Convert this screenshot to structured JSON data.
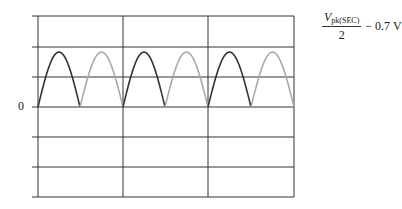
{
  "figure": {
    "zero_label": "0",
    "formula": {
      "numerator_var": "V",
      "numerator_sub": "pk(SEC)",
      "denominator": "2",
      "suffix": "− 0.7 V"
    }
  },
  "grid": {
    "left": 38,
    "right": 294,
    "top": 16,
    "bottom": 197,
    "h_lines": [
      16,
      47,
      77,
      107,
      137,
      167,
      197
    ],
    "v_lines": [
      38,
      123,
      208,
      294
    ],
    "zero_y": 107,
    "line_color": "#333333"
  },
  "waveform": {
    "type": "full-wave rectified",
    "peak_y": 52,
    "half_cycles": [
      {
        "x0": 38,
        "x1": 80,
        "color": "#333333"
      },
      {
        "x0": 80,
        "x1": 123,
        "color": "#aaaaaa"
      },
      {
        "x0": 123,
        "x1": 165,
        "color": "#333333"
      },
      {
        "x0": 165,
        "x1": 208,
        "color": "#aaaaaa"
      },
      {
        "x0": 208,
        "x1": 251,
        "color": "#333333"
      },
      {
        "x0": 251,
        "x1": 294,
        "color": "#aaaaaa"
      }
    ]
  }
}
